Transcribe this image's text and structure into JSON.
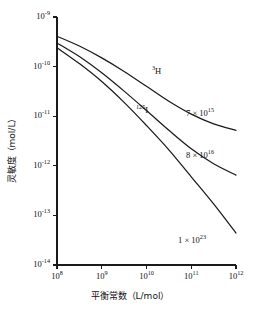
{
  "chart_data": {
    "type": "line",
    "title": "",
    "xlabel": "平衡常数（L/mol）",
    "ylabel": "灵敏度（mol/L）",
    "xscale": "log",
    "yscale": "log",
    "xlim": [
      100000000.0,
      1000000000000.0
    ],
    "ylim": [
      1e-14,
      1e-09
    ],
    "grid": false,
    "legend_position": "inline-annotations",
    "xticks": [
      {
        "value": 100000000.0,
        "label_mantissa": "10",
        "label_exp": "8"
      },
      {
        "value": 1000000000.0,
        "label_mantissa": "10",
        "label_exp": "9"
      },
      {
        "value": 10000000000.0,
        "label_mantissa": "10",
        "label_exp": "10"
      },
      {
        "value": 100000000000.0,
        "label_mantissa": "10",
        "label_exp": "11"
      },
      {
        "value": 1000000000000.0,
        "label_mantissa": "10",
        "label_exp": "12"
      }
    ],
    "yticks": [
      {
        "value": 1e-09,
        "label_mantissa": "10",
        "label_exp": "-9"
      },
      {
        "value": 1e-10,
        "label_mantissa": "10",
        "label_exp": "-10"
      },
      {
        "value": 1e-11,
        "label_mantissa": "10",
        "label_exp": "-11"
      },
      {
        "value": 1e-12,
        "label_mantissa": "10",
        "label_exp": "-12"
      },
      {
        "value": 1e-13,
        "label_mantissa": "10",
        "label_exp": "-13"
      },
      {
        "value": 1e-14,
        "label_mantissa": "10",
        "label_exp": "-14"
      }
    ],
    "series": [
      {
        "name": "3H",
        "isotope_label_base": "H",
        "isotope_label_sup": "3",
        "value_label_mantissa": "7 × 10",
        "value_label_exp": "15",
        "specific_activity": 7000000000000000.0,
        "x": [
          100000000.0,
          316000000.0,
          1000000000.0,
          3160000000.0,
          10000000000.0,
          31600000000.0,
          100000000000.0,
          316000000000.0,
          1000000000000.0
        ],
        "y": [
          4.1e-10,
          2.6e-10,
          1.5e-10,
          8e-11,
          4e-11,
          2e-11,
          1.1e-11,
          7e-12,
          5.2e-12
        ]
      },
      {
        "name": "125I",
        "isotope_label_base": "I",
        "isotope_label_sup": "125",
        "value_label_mantissa": "8 × 10",
        "value_label_exp": "16",
        "specific_activity": 8e+16,
        "x": [
          100000000.0,
          316000000.0,
          1000000000.0,
          3160000000.0,
          10000000000.0,
          31600000000.0,
          100000000000.0,
          316000000000.0,
          1000000000000.0
        ],
        "y": [
          3e-10,
          1.6e-10,
          7.5e-11,
          3.2e-11,
          1.3e-11,
          5.2e-12,
          2.2e-12,
          1.1e-12,
          6.5e-13
        ]
      },
      {
        "name": "1e23",
        "isotope_label_base": "",
        "isotope_label_sup": "",
        "value_label_mantissa": "1 × 10",
        "value_label_exp": "23",
        "specific_activity": 1e+23,
        "x": [
          100000000.0,
          316000000.0,
          1000000000.0,
          3160000000.0,
          10000000000.0,
          31600000000.0,
          100000000000.0,
          316000000000.0,
          1000000000000.0
        ],
        "y": [
          2.4e-10,
          1.15e-10,
          5e-11,
          1.9e-11,
          6.5e-12,
          2.1e-12,
          6e-13,
          1.7e-13,
          4.4e-14
        ]
      }
    ],
    "annotations": [
      {
        "text": "3H",
        "x_px": 157,
        "y_px": 69
      },
      {
        "text": "125I",
        "x_px": 140,
        "y_px": 108
      },
      {
        "text": "7 × 10^15",
        "x_px": 192,
        "y_px": 113
      },
      {
        "text": "8 × 10^16",
        "x_px": 192,
        "y_px": 155
      },
      {
        "text": "1 × 10^23",
        "x_px": 186,
        "y_px": 240
      }
    ]
  }
}
